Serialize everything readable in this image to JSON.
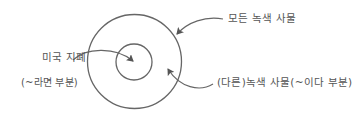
{
  "diagram": {
    "type": "nested-set (venn) diagram",
    "stroke_color": "#666666",
    "text_color": "#555555",
    "outer_set": {
      "label": "모든 녹색 사물",
      "shape": "circle",
      "center": [
        134.5,
        61.5
      ],
      "radius": 47
    },
    "inner_set": {
      "label": "미국 지폐",
      "sub_label": "(~라면 부분)",
      "shape": "circle",
      "center": [
        134,
        62
      ],
      "radius": 18
    },
    "ring_region": {
      "label": "(다른)녹색 사물(~이다 부분)"
    },
    "arrows": [
      {
        "from": "모든 녹색 사물",
        "to": "outer circle"
      },
      {
        "from": "미국 지폐",
        "to": "inner circle center"
      },
      {
        "from": "(다른)녹색 사물(~이다 부분)",
        "to": "ring between circles"
      }
    ]
  }
}
